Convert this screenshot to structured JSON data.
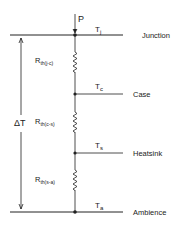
{
  "diagram": {
    "power_label": "P",
    "delta_label": "ΔT",
    "levels": [
      {
        "name": "Junction",
        "temp_main": "T",
        "temp_sub": "j",
        "y": 35
      },
      {
        "name": "Case",
        "temp_main": "T",
        "temp_sub": "c",
        "y": 94
      },
      {
        "name": "Heatsink",
        "temp_main": "T",
        "temp_sub": "s",
        "y": 153
      },
      {
        "name": "Ambience",
        "temp_main": "T",
        "temp_sub": "a",
        "y": 212
      }
    ],
    "resistors": [
      {
        "main": "R",
        "sub": "th(j-c)"
      },
      {
        "main": "R",
        "sub": "th(c-s)"
      },
      {
        "main": "R",
        "sub": "th(s-a)"
      }
    ],
    "colors": {
      "line": "#222222",
      "background": "#ffffff"
    }
  }
}
